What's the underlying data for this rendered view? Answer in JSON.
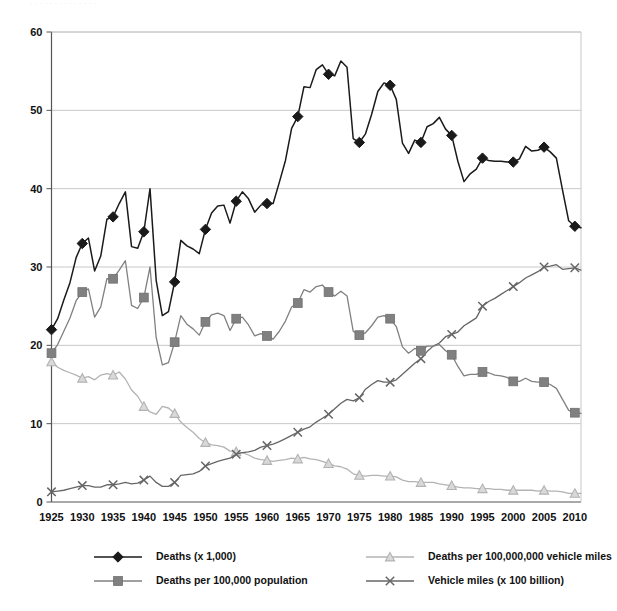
{
  "top_cut_text": "· · · · · · · · · · · · · ·",
  "chart_data": {
    "type": "line",
    "title": "",
    "xlabel": "",
    "ylabel": "",
    "xlim": [
      1925,
      2011
    ],
    "ylim": [
      0,
      60
    ],
    "yticks": [
      0,
      10,
      20,
      30,
      40,
      50,
      60
    ],
    "xticks": [
      1925,
      1930,
      1935,
      1940,
      1945,
      1950,
      1955,
      1960,
      1965,
      1970,
      1975,
      1980,
      1985,
      1990,
      1995,
      2000,
      2005,
      2010
    ],
    "grid": "horizontal",
    "legend_position": "bottom",
    "marker_interval_years": 5,
    "colors": {
      "deaths": "#1a1a1a",
      "deaths_per_population": "#808080",
      "deaths_per_vehicle_miles": "#b3b3b3",
      "vehicle_miles": "#666666",
      "gridline": "#c8c8c8",
      "axis": "#555555",
      "background": "#ffffff"
    },
    "series": [
      {
        "name": "Deaths (x 1,000)",
        "key": "deaths",
        "marker": "diamond",
        "color": "#1a1a1a",
        "x": [
          1925,
          1926,
          1927,
          1928,
          1929,
          1930,
          1931,
          1932,
          1933,
          1934,
          1935,
          1936,
          1937,
          1938,
          1939,
          1940,
          1941,
          1942,
          1943,
          1944,
          1945,
          1946,
          1947,
          1948,
          1949,
          1950,
          1951,
          1952,
          1953,
          1954,
          1955,
          1956,
          1957,
          1958,
          1959,
          1960,
          1961,
          1962,
          1963,
          1964,
          1965,
          1966,
          1967,
          1968,
          1969,
          1970,
          1971,
          1972,
          1973,
          1974,
          1975,
          1976,
          1977,
          1978,
          1979,
          1980,
          1981,
          1982,
          1983,
          1984,
          1985,
          1986,
          1987,
          1988,
          1989,
          1990,
          1991,
          1992,
          1993,
          1994,
          1995,
          1996,
          1997,
          1998,
          1999,
          2000,
          2001,
          2002,
          2003,
          2004,
          2005,
          2006,
          2007,
          2008,
          2009,
          2010,
          2011
        ],
        "values": [
          22.0,
          23.4,
          25.8,
          28.0,
          31.2,
          33.0,
          33.7,
          29.5,
          31.4,
          36.1,
          36.4,
          38.1,
          39.6,
          32.6,
          32.4,
          34.5,
          40.0,
          28.3,
          23.8,
          24.3,
          28.1,
          33.4,
          32.7,
          32.3,
          31.7,
          34.8,
          36.9,
          37.8,
          37.9,
          35.6,
          38.4,
          39.6,
          38.7,
          37.0,
          37.9,
          38.1,
          38.1,
          40.8,
          43.6,
          47.7,
          49.2,
          53.0,
          52.9,
          55.2,
          55.8,
          54.6,
          54.4,
          56.3,
          55.5,
          46.4,
          45.9,
          47.0,
          49.5,
          52.4,
          53.5,
          53.2,
          51.4,
          45.8,
          44.5,
          46.2,
          45.9,
          47.9,
          48.3,
          49.1,
          47.6,
          46.8,
          43.5,
          40.9,
          41.9,
          42.5,
          43.9,
          43.6,
          43.5,
          43.5,
          43.4,
          43.4,
          43.8,
          45.4,
          44.8,
          44.9,
          45.3,
          44.7,
          43.9,
          39.8,
          35.9,
          35.2,
          35.0
        ]
      },
      {
        "name": "Deaths per 100,000 population",
        "key": "deaths_per_population",
        "marker": "square",
        "color": "#808080",
        "x": [
          1925,
          1926,
          1927,
          1928,
          1929,
          1930,
          1931,
          1932,
          1933,
          1934,
          1935,
          1936,
          1937,
          1938,
          1939,
          1940,
          1941,
          1942,
          1943,
          1944,
          1945,
          1946,
          1947,
          1948,
          1949,
          1950,
          1951,
          1952,
          1953,
          1954,
          1955,
          1956,
          1957,
          1958,
          1959,
          1960,
          1961,
          1962,
          1963,
          1964,
          1965,
          1966,
          1967,
          1968,
          1969,
          1970,
          1971,
          1972,
          1973,
          1974,
          1975,
          1976,
          1977,
          1978,
          1979,
          1980,
          1981,
          1982,
          1983,
          1984,
          1985,
          1986,
          1987,
          1988,
          1989,
          1990,
          1991,
          1992,
          1993,
          1994,
          1995,
          1996,
          1997,
          1998,
          1999,
          2000,
          2001,
          2002,
          2003,
          2004,
          2005,
          2006,
          2007,
          2008,
          2009,
          2010,
          2011
        ],
        "values": [
          19.0,
          20.1,
          21.8,
          23.5,
          25.7,
          26.8,
          27.2,
          23.6,
          24.9,
          28.5,
          28.5,
          29.6,
          30.8,
          25.1,
          24.7,
          26.1,
          30.0,
          21.0,
          17.5,
          17.8,
          20.4,
          23.8,
          22.7,
          22.1,
          21.3,
          23.0,
          23.9,
          24.1,
          23.8,
          21.9,
          23.4,
          23.6,
          22.6,
          21.2,
          21.5,
          21.2,
          20.8,
          21.8,
          23.1,
          24.9,
          25.4,
          27.1,
          26.8,
          27.5,
          27.7,
          26.8,
          26.3,
          26.9,
          26.3,
          21.8,
          21.3,
          21.6,
          22.5,
          23.6,
          23.8,
          23.4,
          22.4,
          19.8,
          19.0,
          19.6,
          19.3,
          19.9,
          19.9,
          20.1,
          19.3,
          18.8,
          17.3,
          16.1,
          16.3,
          16.3,
          16.6,
          16.5,
          16.2,
          16.1,
          15.9,
          15.4,
          15.4,
          15.8,
          15.4,
          15.3,
          15.3,
          15.0,
          14.5,
          13.1,
          11.7,
          11.4,
          11.3
        ]
      },
      {
        "name": "Deaths per 100,000,000 vehicle miles",
        "key": "deaths_per_vehicle_miles",
        "marker": "triangle",
        "color": "#b3b3b3",
        "x": [
          1925,
          1926,
          1927,
          1928,
          1929,
          1930,
          1931,
          1932,
          1933,
          1934,
          1935,
          1936,
          1937,
          1938,
          1939,
          1940,
          1941,
          1942,
          1943,
          1944,
          1945,
          1946,
          1947,
          1948,
          1949,
          1950,
          1951,
          1952,
          1953,
          1954,
          1955,
          1956,
          1957,
          1958,
          1959,
          1960,
          1961,
          1962,
          1963,
          1964,
          1965,
          1966,
          1967,
          1968,
          1969,
          1970,
          1971,
          1972,
          1973,
          1974,
          1975,
          1976,
          1977,
          1978,
          1979,
          1980,
          1981,
          1982,
          1983,
          1984,
          1985,
          1986,
          1987,
          1988,
          1989,
          1990,
          1991,
          1992,
          1993,
          1994,
          1995,
          1996,
          1997,
          1998,
          1999,
          2000,
          2001,
          2002,
          2003,
          2004,
          2005,
          2006,
          2007,
          2008,
          2009,
          2010,
          2011
        ],
        "values": [
          17.9,
          17.2,
          16.8,
          16.5,
          16.2,
          15.8,
          16.0,
          15.6,
          16.2,
          16.4,
          16.2,
          16.6,
          15.7,
          14.3,
          13.5,
          12.2,
          11.5,
          11.2,
          12.2,
          12.0,
          11.3,
          10.2,
          9.5,
          8.9,
          8.1,
          7.6,
          7.3,
          7.2,
          7.0,
          6.5,
          6.4,
          6.3,
          6.0,
          5.6,
          5.4,
          5.3,
          5.2,
          5.3,
          5.4,
          5.6,
          5.5,
          5.7,
          5.5,
          5.4,
          5.2,
          4.9,
          4.6,
          4.5,
          4.2,
          3.6,
          3.4,
          3.3,
          3.4,
          3.4,
          3.3,
          3.3,
          3.2,
          2.8,
          2.6,
          2.6,
          2.5,
          2.5,
          2.5,
          2.3,
          2.2,
          2.1,
          1.9,
          1.8,
          1.8,
          1.7,
          1.7,
          1.7,
          1.6,
          1.6,
          1.5,
          1.5,
          1.5,
          1.5,
          1.5,
          1.4,
          1.5,
          1.4,
          1.4,
          1.3,
          1.1,
          1.1,
          1.1
        ]
      },
      {
        "name": "Vehicle miles (x 100 billion)",
        "key": "vehicle_miles",
        "marker": "x",
        "color": "#666666",
        "x": [
          1925,
          1926,
          1927,
          1928,
          1929,
          1930,
          1931,
          1932,
          1933,
          1934,
          1935,
          1936,
          1937,
          1938,
          1939,
          1940,
          1941,
          1942,
          1943,
          1944,
          1945,
          1946,
          1947,
          1948,
          1949,
          1950,
          1951,
          1952,
          1953,
          1954,
          1955,
          1956,
          1957,
          1958,
          1959,
          1960,
          1961,
          1962,
          1963,
          1964,
          1965,
          1966,
          1967,
          1968,
          1969,
          1970,
          1971,
          1972,
          1973,
          1974,
          1975,
          1976,
          1977,
          1978,
          1979,
          1980,
          1981,
          1982,
          1983,
          1984,
          1985,
          1986,
          1987,
          1988,
          1989,
          1990,
          1991,
          1992,
          1993,
          1994,
          1995,
          1996,
          1997,
          1998,
          1999,
          2000,
          2001,
          2002,
          2003,
          2004,
          2005,
          2006,
          2007,
          2008,
          2009,
          2010,
          2011
        ],
        "values": [
          1.3,
          1.4,
          1.5,
          1.7,
          1.9,
          2.1,
          2.1,
          1.9,
          1.9,
          2.2,
          2.2,
          2.3,
          2.5,
          2.3,
          2.4,
          2.8,
          3.3,
          2.5,
          2.0,
          2.0,
          2.5,
          3.4,
          3.5,
          3.6,
          3.9,
          4.6,
          4.9,
          5.2,
          5.4,
          5.6,
          6.1,
          6.3,
          6.4,
          6.6,
          7.0,
          7.2,
          7.4,
          7.7,
          8.1,
          8.5,
          8.9,
          9.3,
          9.6,
          10.2,
          10.7,
          11.2,
          11.9,
          12.6,
          13.1,
          12.9,
          13.3,
          14.4,
          15.0,
          15.5,
          15.3,
          15.3,
          15.6,
          16.3,
          17.0,
          17.7,
          18.3,
          19.2,
          19.9,
          20.3,
          21.1,
          21.4,
          21.7,
          22.5,
          23.0,
          23.5,
          25.0,
          25.6,
          26.0,
          26.5,
          27.0,
          27.5,
          28.0,
          28.6,
          29.0,
          29.4,
          30.0,
          30.1,
          30.3,
          29.7,
          29.8,
          29.9,
          29.6
        ]
      }
    ]
  },
  "axis": {
    "y_labels": [
      "0",
      "10",
      "20",
      "30",
      "40",
      "50",
      "60"
    ],
    "x_labels": [
      "1925",
      "1930",
      "1935",
      "1940",
      "1945",
      "1950",
      "1955",
      "1960",
      "1965",
      "1970",
      "1975",
      "1980",
      "1985",
      "1990",
      "1995",
      "2000",
      "2005",
      "2010"
    ]
  },
  "legend": {
    "entries": [
      {
        "label": "Deaths (x 1,000)",
        "marker": "diamond",
        "color": "#1a1a1a"
      },
      {
        "label": "Deaths per 100,000,000 vehicle miles",
        "marker": "triangle",
        "color": "#b3b3b3"
      },
      {
        "label": "Deaths per 100,000 population",
        "marker": "square",
        "color": "#808080"
      },
      {
        "label": "Vehicle miles (x 100 billion)",
        "marker": "x",
        "color": "#666666"
      }
    ]
  }
}
